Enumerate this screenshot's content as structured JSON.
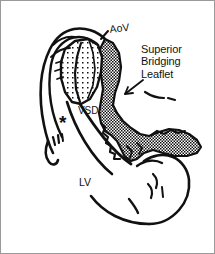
{
  "figure": {
    "kind": "anatomical-line-drawing",
    "background_color": "#ffffff",
    "ink_color": "#111111",
    "frame_color": "#9a9a9a",
    "labels": {
      "aortic_valve": "AoV",
      "superior_bridging_leaflet_line1": "Superior",
      "superior_bridging_leaflet_line2": "Bridging",
      "superior_bridging_leaflet_line3": "Leaflet",
      "ventricular_septal_defect": "VSD",
      "left_ventricle": "LV",
      "asterisk_marker": "*"
    },
    "regions": {
      "stippled_label": "stippled-myocardium-region",
      "crosshatched_label": "crosshatched-bridging-leaflet-region"
    },
    "annotations": {
      "leader_to_aov": "leader-line-aov",
      "arrow_to_leaflet": "arrow-superior-bridging-leaflet"
    }
  }
}
